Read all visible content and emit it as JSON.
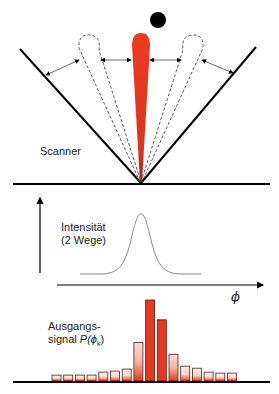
{
  "diagram": {
    "type": "radar-scanner-beam-illustration",
    "colors": {
      "beam": "#e8321e",
      "target": "#000000",
      "line": "#000000",
      "curve": "#888888",
      "bar_fill_top": "#e8321e",
      "bar_fill_light": "#f7d6cf"
    },
    "scanner_panel": {
      "label": "Scanner",
      "target_icon": "black-dot",
      "beams": [
        "left-dashed-lobe",
        "center-red-lobe",
        "right-dashed-lobe"
      ]
    },
    "intensity_panel": {
      "label_line1": "Intensität",
      "label_line2": "(2 Wege)",
      "x_axis_symbol": "ϕ"
    },
    "output_panel": {
      "label_line1": "Ausgangs-",
      "label_line2_prefix": "signal ",
      "label_line2_func": "P(ϕ",
      "label_line2_sub": "k",
      "label_line2_close": ")"
    }
  },
  "chart_data": {
    "type": "bar",
    "xlabel": "ϕ",
    "ylabel": "",
    "categories": [
      "k1",
      "k2",
      "k3",
      "k4",
      "k5",
      "k6",
      "k7",
      "k8",
      "k9",
      "k10",
      "k11",
      "k12",
      "k13",
      "k14",
      "k15",
      "k16"
    ],
    "values": [
      6,
      6,
      6,
      6,
      9,
      10,
      12,
      39,
      82,
      62,
      27,
      15,
      13,
      9,
      8,
      8
    ],
    "gaussian_curve": {
      "label": "Intensität (2 Wege)",
      "peak_position": "center",
      "shape": "bell"
    }
  }
}
